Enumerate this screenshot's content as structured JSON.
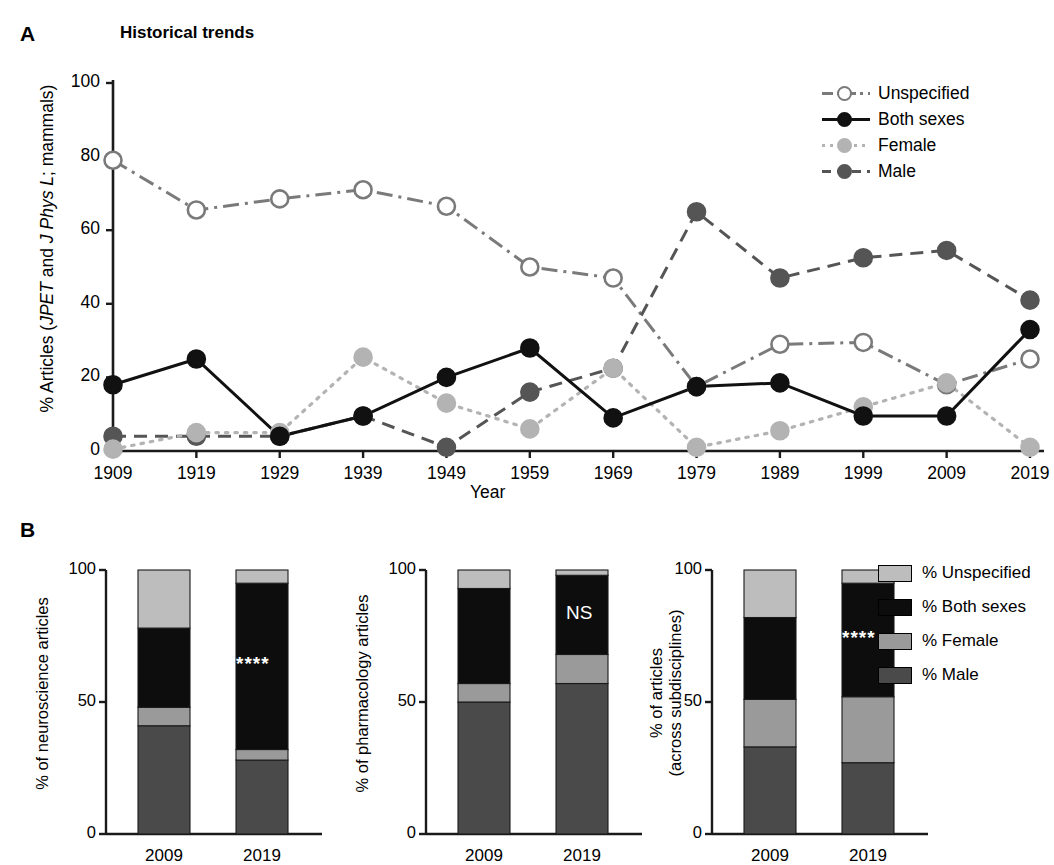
{
  "figure": {
    "panels": [
      {
        "letter": "A",
        "title": "Historical trends"
      },
      {
        "letter": "B",
        "title": ""
      }
    ]
  },
  "panelA": {
    "letter": "A",
    "title": "Historical trends",
    "ylabel_prefix": "% Articles (",
    "ylabel_italic1": "JPET",
    "ylabel_mid": " and ",
    "ylabel_italic2": "J Phys L",
    "ylabel_suffix": "; mammals)",
    "ylabel_plain": "% Articles (JPET and J Phys L; mammals)",
    "xlabel": "Year",
    "yticks": [
      "0",
      "20",
      "40",
      "60",
      "80",
      "100"
    ],
    "xticks": [
      "1909",
      "1919",
      "1929",
      "1939",
      "1949",
      "1959",
      "1969",
      "1979",
      "1989",
      "1999",
      "2009",
      "2019"
    ],
    "legend": [
      {
        "label": "Unspecified",
        "color": "#7a7a7a",
        "fill": "#ffffff",
        "dash": "dashdot"
      },
      {
        "label": "Both sexes",
        "color": "#111111",
        "fill": "#111111",
        "dash": "solid"
      },
      {
        "label": "Female",
        "color": "#b3b3b3",
        "fill": "#b3b3b3",
        "dash": "dotted"
      },
      {
        "label": "Male",
        "color": "#555555",
        "fill": "#555555",
        "dash": "dashed"
      }
    ]
  },
  "panelB": {
    "letter": "B",
    "yticks": [
      "0",
      "50",
      "100"
    ],
    "xticks": [
      "2009",
      "2019"
    ],
    "charts": [
      {
        "ylabel": "% of neuroscience articles",
        "ylabel_lines": [
          "% of neuroscience articles"
        ],
        "annotation": "****",
        "annotation_type": "stars"
      },
      {
        "ylabel": "% of pharmacology articles",
        "ylabel_lines": [
          "% of pharmacology articles"
        ],
        "annotation": "NS",
        "annotation_type": "ns"
      },
      {
        "ylabel": "% of articles (across subdisciplines)",
        "ylabel_lines": [
          "% of articles",
          "(across subdisciplines)"
        ],
        "annotation": "****",
        "annotation_type": "stars"
      }
    ],
    "legend": [
      {
        "label": "% Unspecified",
        "color": "#bdbdbd"
      },
      {
        "label": "% Both sexes",
        "color": "#0d0d0d"
      },
      {
        "label": "% Female",
        "color": "#9a9a9a"
      },
      {
        "label": "% Male",
        "color": "#4a4a4a"
      }
    ]
  },
  "chart_data": [
    {
      "type": "line",
      "panel": "A",
      "title": "Historical trends",
      "xlabel": "Year",
      "ylabel": "% Articles (JPET and J Phys L; mammals)",
      "x": [
        1909,
        1919,
        1929,
        1939,
        1949,
        1959,
        1969,
        1979,
        1989,
        1999,
        2009,
        2019
      ],
      "xlim": [
        1904,
        2024
      ],
      "ylim": [
        0,
        100
      ],
      "yticks": [
        0,
        20,
        40,
        60,
        80,
        100
      ],
      "grid": false,
      "legend_position": "top-right",
      "series": [
        {
          "name": "Unspecified",
          "color": "#7a7a7a",
          "fill": "#ffffff",
          "dash": "dashdot",
          "values": [
            79,
            65.5,
            68.5,
            71,
            66.5,
            50,
            47,
            17.5,
            29,
            29.5,
            18,
            25
          ]
        },
        {
          "name": "Both sexes",
          "color": "#111111",
          "fill": "#111111",
          "dash": "solid",
          "values": [
            18,
            25,
            4,
            9.5,
            20,
            28,
            9,
            17.5,
            18.5,
            9.5,
            9.5,
            33
          ]
        },
        {
          "name": "Female",
          "color": "#b3b3b3",
          "fill": "#b3b3b3",
          "dash": "dotted",
          "values": [
            0.5,
            5,
            5,
            25.5,
            13,
            6,
            22.5,
            1,
            5.5,
            12,
            18.5,
            1
          ]
        },
        {
          "name": "Male",
          "color": "#555555",
          "fill": "#555555",
          "dash": "dashed",
          "values": [
            4,
            4,
            4,
            9.5,
            1,
            16,
            22.5,
            65,
            47,
            52.5,
            54.5,
            41
          ]
        }
      ]
    },
    {
      "type": "bar",
      "panel": "B1",
      "subtype": "stacked",
      "title": "",
      "ylabel": "% of neuroscience articles",
      "categories": [
        "2009",
        "2019"
      ],
      "ylim": [
        0,
        100
      ],
      "yticks": [
        0,
        50,
        100
      ],
      "annotation": "****",
      "series": [
        {
          "name": "% Male",
          "color": "#4a4a4a",
          "values": [
            41,
            28
          ]
        },
        {
          "name": "% Female",
          "color": "#9a9a9a",
          "values": [
            7,
            4
          ]
        },
        {
          "name": "% Both sexes",
          "color": "#0d0d0d",
          "values": [
            30,
            63
          ]
        },
        {
          "name": "% Unspecified",
          "color": "#bdbdbd",
          "values": [
            22,
            5
          ]
        }
      ]
    },
    {
      "type": "bar",
      "panel": "B2",
      "subtype": "stacked",
      "title": "",
      "ylabel": "% of pharmacology articles",
      "categories": [
        "2009",
        "2019"
      ],
      "ylim": [
        0,
        100
      ],
      "yticks": [
        0,
        50,
        100
      ],
      "annotation": "NS",
      "series": [
        {
          "name": "% Male",
          "color": "#4a4a4a",
          "values": [
            50,
            57
          ]
        },
        {
          "name": "% Female",
          "color": "#9a9a9a",
          "values": [
            7,
            11
          ]
        },
        {
          "name": "% Both sexes",
          "color": "#0d0d0d",
          "values": [
            36,
            30
          ]
        },
        {
          "name": "% Unspecified",
          "color": "#bdbdbd",
          "values": [
            7,
            2
          ]
        }
      ]
    },
    {
      "type": "bar",
      "panel": "B3",
      "subtype": "stacked",
      "title": "",
      "ylabel": "% of articles (across subdisciplines)",
      "categories": [
        "2009",
        "2019"
      ],
      "ylim": [
        0,
        100
      ],
      "yticks": [
        0,
        50,
        100
      ],
      "annotation": "****",
      "series": [
        {
          "name": "% Male",
          "color": "#4a4a4a",
          "values": [
            33,
            27
          ]
        },
        {
          "name": "% Female",
          "color": "#9a9a9a",
          "values": [
            18,
            25
          ]
        },
        {
          "name": "% Both sexes",
          "color": "#0d0d0d",
          "values": [
            31,
            43
          ]
        },
        {
          "name": "% Unspecified",
          "color": "#bdbdbd",
          "values": [
            18,
            5
          ]
        }
      ]
    }
  ]
}
